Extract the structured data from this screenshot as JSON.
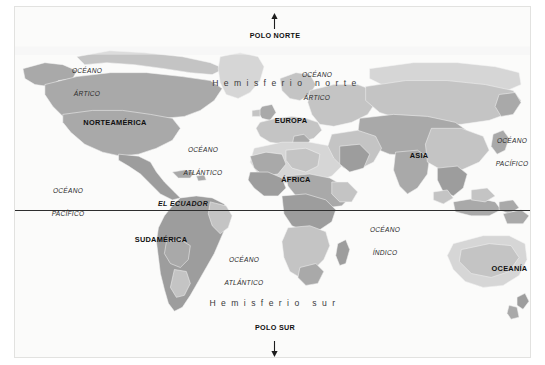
{
  "map": {
    "title": "Mapa del mundo",
    "projection": "equirectangular",
    "colors": {
      "background": "#fbfbfa",
      "land": "#a9a9a9",
      "land_light": "#c9c9c9",
      "land_lighter": "#d8d8d8",
      "border": "#efefef",
      "equator": "#2e2e2e",
      "frame": "#e2e2e0",
      "text": "#1d1d1d"
    },
    "poles": [
      {
        "id": "north",
        "label": "POLO NORTE",
        "arrow": "up",
        "x": 260,
        "y": 38
      },
      {
        "id": "south",
        "label": "POLO SUR",
        "arrow": "down",
        "x": 260,
        "y": 325
      }
    ],
    "hemispheres": [
      {
        "id": "north",
        "label": "Hemisferio norte",
        "x": 272,
        "y": 80
      },
      {
        "id": "south",
        "label": "Hemisferio sur",
        "x": 260,
        "y": 301
      }
    ],
    "equator": {
      "label": "EL ECUADOR",
      "x": 176,
      "y": 194
    },
    "continents": [
      {
        "id": "norteamerica",
        "label": "NORTEAMÉRICA",
        "x": 100,
        "y": 119
      },
      {
        "id": "sudamerica",
        "label": "SUDAMÉRICA",
        "x": 149,
        "y": 236
      },
      {
        "id": "europa",
        "label": "EUROPA",
        "x": 280,
        "y": 117
      },
      {
        "id": "africa",
        "label": "ÁFRICA",
        "x": 281,
        "y": 176
      },
      {
        "id": "asia",
        "label": "ASIA",
        "x": 404,
        "y": 152
      },
      {
        "id": "oceania",
        "label": "OCEANÍA",
        "x": 494,
        "y": 265
      }
    ],
    "oceans": [
      {
        "id": "artico-oeste",
        "line1": "OCÉANO",
        "line2": "ÁRTICO",
        "x": 72,
        "y": 56
      },
      {
        "id": "artico-este",
        "line1": "OCÉANO",
        "line2": "ÁRTICO",
        "x": 302,
        "y": 60
      },
      {
        "id": "pacifico-oeste",
        "line1": "OCÉANO",
        "line2": "PACÍFICO",
        "x": 53,
        "y": 176
      },
      {
        "id": "pacifico-este",
        "line1": "OCÉANO",
        "line2": "PACÍFICO",
        "x": 497,
        "y": 126
      },
      {
        "id": "atlantico-norte",
        "line1": "OCÉANO",
        "line2": "ATLÁNTICO",
        "x": 188,
        "y": 135
      },
      {
        "id": "atlantico-sur",
        "line1": "OCÉANO",
        "line2": "ATLÁNTICO",
        "x": 229,
        "y": 245
      },
      {
        "id": "indico",
        "line1": "OCÉANO",
        "line2": "ÍNDICO",
        "x": 370,
        "y": 215
      }
    ]
  }
}
